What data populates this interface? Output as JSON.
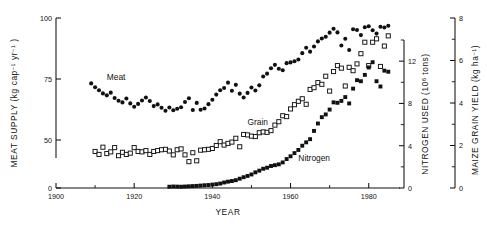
{
  "chart_data": {
    "type": "scatter",
    "title": "",
    "xlabel": "YEAR",
    "xlim": [
      1900,
      1988
    ],
    "x_major_ticks": [
      1900,
      1920,
      1940,
      1960,
      1980
    ],
    "x_minor_ticks": [
      1910,
      1930,
      1950,
      1970
    ],
    "grid": false,
    "legend": "inline-labels",
    "axes": [
      {
        "id": "meat",
        "label": "MEAT SUPPLY",
        "units": "(kg cap−1 yr−1)",
        "unit_parts": [
          "(kg cap",
          "−1",
          " yr",
          "−1",
          ")"
        ],
        "side": "left",
        "ticks": [
          0,
          50,
          75,
          100
        ],
        "broken": true,
        "range": [
          45,
          102
        ]
      },
      {
        "id": "nitrogen",
        "label": "NITROGEN USED",
        "units": "(10⁶ tons)",
        "unit_parts": [
          "(10",
          "6",
          " tons)"
        ],
        "side": "right-inner",
        "ticks": [
          0,
          4,
          8,
          12
        ],
        "minor_ticks": [
          2,
          6,
          10,
          14
        ],
        "range": [
          0,
          14
        ]
      },
      {
        "id": "maize",
        "label": "MAIZE GRAIN YIELD",
        "units": "(kg ha−1)",
        "unit_parts": [
          "(kg ha",
          "−1",
          ")"
        ],
        "side": "right-outer",
        "ticks": [
          0,
          2,
          4,
          6,
          8
        ],
        "minor_ticks": [
          1,
          3,
          5,
          7
        ],
        "range": [
          0,
          8
        ]
      }
    ],
    "series": [
      {
        "name": "Meat",
        "marker": "filled-circle",
        "axis": "meat",
        "label_position": {
          "year": 1913,
          "value": 74.5
        },
        "points": [
          [
            1909,
            73.2
          ],
          [
            1910,
            71.6
          ],
          [
            1911,
            70.4
          ],
          [
            1912,
            69.1
          ],
          [
            1913,
            68.3
          ],
          [
            1914,
            69.4
          ],
          [
            1915,
            67.2
          ],
          [
            1916,
            66.1
          ],
          [
            1917,
            65.4
          ],
          [
            1918,
            67.0
          ],
          [
            1919,
            65.0
          ],
          [
            1920,
            63.6
          ],
          [
            1921,
            64.8
          ],
          [
            1922,
            66.2
          ],
          [
            1923,
            67.4
          ],
          [
            1924,
            66.0
          ],
          [
            1925,
            63.9
          ],
          [
            1926,
            64.6
          ],
          [
            1927,
            63.2
          ],
          [
            1928,
            62.0
          ],
          [
            1929,
            63.3
          ],
          [
            1930,
            62.2
          ],
          [
            1931,
            62.8
          ],
          [
            1932,
            63.4
          ],
          [
            1933,
            65.6
          ],
          [
            1934,
            67.1
          ],
          [
            1935,
            62.3
          ],
          [
            1936,
            65.2
          ],
          [
            1937,
            62.4
          ],
          [
            1938,
            62.9
          ],
          [
            1939,
            64.7
          ],
          [
            1940,
            66.5
          ],
          [
            1941,
            68.6
          ],
          [
            1942,
            70.4
          ],
          [
            1943,
            71.3
          ],
          [
            1944,
            73.5
          ],
          [
            1945,
            70.2
          ],
          [
            1946,
            72.6
          ],
          [
            1947,
            69.0
          ],
          [
            1948,
            67.4
          ],
          [
            1949,
            69.3
          ],
          [
            1950,
            71.5
          ],
          [
            1951,
            70.3
          ],
          [
            1952,
            72.4
          ],
          [
            1953,
            76.0
          ],
          [
            1954,
            77.2
          ],
          [
            1955,
            79.4
          ],
          [
            1956,
            80.8
          ],
          [
            1957,
            79.2
          ],
          [
            1958,
            78.6
          ],
          [
            1959,
            81.5
          ],
          [
            1960,
            81.8
          ],
          [
            1961,
            82.3
          ],
          [
            1962,
            83.0
          ],
          [
            1963,
            85.6
          ],
          [
            1964,
            87.8
          ],
          [
            1965,
            86.2
          ],
          [
            1966,
            88.3
          ],
          [
            1967,
            90.4
          ],
          [
            1968,
            91.6
          ],
          [
            1969,
            92.3
          ],
          [
            1970,
            94.0
          ],
          [
            1971,
            95.6
          ],
          [
            1972,
            94.1
          ],
          [
            1973,
            88.7
          ],
          [
            1974,
            91.5
          ],
          [
            1975,
            86.9
          ],
          [
            1976,
            95.4
          ],
          [
            1977,
            95.1
          ],
          [
            1978,
            93.0
          ],
          [
            1979,
            96.2
          ],
          [
            1980,
            96.6
          ],
          [
            1981,
            95.0
          ],
          [
            1982,
            93.6
          ],
          [
            1983,
            96.4
          ],
          [
            1984,
            96.1
          ],
          [
            1985,
            96.8
          ]
        ]
      },
      {
        "name": "Grain",
        "marker": "open-square",
        "axis": "maize",
        "label_position": {
          "year": 1949,
          "value": 2.95
        },
        "points": [
          [
            1910,
            1.72
          ],
          [
            1911,
            1.58
          ],
          [
            1912,
            1.92
          ],
          [
            1913,
            1.62
          ],
          [
            1914,
            1.7
          ],
          [
            1915,
            1.9
          ],
          [
            1916,
            1.52
          ],
          [
            1917,
            1.68
          ],
          [
            1918,
            1.58
          ],
          [
            1919,
            1.64
          ],
          [
            1920,
            1.9
          ],
          [
            1921,
            1.72
          ],
          [
            1922,
            1.7
          ],
          [
            1923,
            1.76
          ],
          [
            1924,
            1.58
          ],
          [
            1925,
            1.72
          ],
          [
            1926,
            1.76
          ],
          [
            1927,
            1.8
          ],
          [
            1928,
            1.82
          ],
          [
            1929,
            1.74
          ],
          [
            1930,
            1.56
          ],
          [
            1931,
            1.8
          ],
          [
            1932,
            1.84
          ],
          [
            1933,
            1.56
          ],
          [
            1934,
            1.24
          ],
          [
            1935,
            1.66
          ],
          [
            1936,
            1.28
          ],
          [
            1937,
            1.78
          ],
          [
            1938,
            1.8
          ],
          [
            1939,
            1.82
          ],
          [
            1940,
            1.86
          ],
          [
            1941,
            2.0
          ],
          [
            1942,
            2.18
          ],
          [
            1943,
            2.02
          ],
          [
            1944,
            2.1
          ],
          [
            1945,
            2.16
          ],
          [
            1946,
            2.34
          ],
          [
            1947,
            1.94
          ],
          [
            1948,
            2.52
          ],
          [
            1949,
            2.5
          ],
          [
            1950,
            2.44
          ],
          [
            1951,
            2.42
          ],
          [
            1952,
            2.6
          ],
          [
            1953,
            2.64
          ],
          [
            1954,
            2.62
          ],
          [
            1955,
            2.7
          ],
          [
            1956,
            2.96
          ],
          [
            1957,
            3.12
          ],
          [
            1958,
            3.4
          ],
          [
            1959,
            3.36
          ],
          [
            1960,
            3.72
          ],
          [
            1961,
            3.92
          ],
          [
            1962,
            4.08
          ],
          [
            1963,
            4.2
          ],
          [
            1964,
            3.94
          ],
          [
            1965,
            4.64
          ],
          [
            1966,
            4.72
          ],
          [
            1967,
            4.96
          ],
          [
            1968,
            4.88
          ],
          [
            1969,
            5.26
          ],
          [
            1970,
            4.56
          ],
          [
            1971,
            5.48
          ],
          [
            1972,
            5.76
          ],
          [
            1973,
            5.64
          ],
          [
            1974,
            4.8
          ],
          [
            1975,
            5.68
          ],
          [
            1976,
            5.52
          ],
          [
            1977,
            5.84
          ],
          [
            1978,
            6.32
          ],
          [
            1979,
            6.86
          ],
          [
            1980,
            5.76
          ],
          [
            1981,
            6.86
          ],
          [
            1982,
            7.02
          ],
          [
            1983,
            5.72
          ],
          [
            1984,
            6.68
          ],
          [
            1985,
            7.16
          ]
        ]
      },
      {
        "name": "Nitrogen",
        "marker": "filled-square",
        "axis": "nitrogen",
        "label_position": {
          "year": 1962,
          "value": 2.6
        },
        "points": [
          [
            1929,
            0.12
          ],
          [
            1930,
            0.14
          ],
          [
            1931,
            0.13
          ],
          [
            1932,
            0.12
          ],
          [
            1933,
            0.14
          ],
          [
            1934,
            0.16
          ],
          [
            1935,
            0.18
          ],
          [
            1936,
            0.2
          ],
          [
            1937,
            0.23
          ],
          [
            1938,
            0.26
          ],
          [
            1939,
            0.28
          ],
          [
            1940,
            0.32
          ],
          [
            1941,
            0.36
          ],
          [
            1942,
            0.42
          ],
          [
            1943,
            0.52
          ],
          [
            1944,
            0.6
          ],
          [
            1945,
            0.66
          ],
          [
            1946,
            0.74
          ],
          [
            1947,
            0.88
          ],
          [
            1948,
            1.02
          ],
          [
            1949,
            1.14
          ],
          [
            1950,
            1.28
          ],
          [
            1951,
            1.48
          ],
          [
            1952,
            1.64
          ],
          [
            1953,
            1.82
          ],
          [
            1954,
            1.92
          ],
          [
            1955,
            2.08
          ],
          [
            1956,
            2.16
          ],
          [
            1957,
            2.24
          ],
          [
            1958,
            2.42
          ],
          [
            1959,
            2.74
          ],
          [
            1960,
            3.0
          ],
          [
            1961,
            3.3
          ],
          [
            1962,
            3.6
          ],
          [
            1963,
            4.0
          ],
          [
            1964,
            4.32
          ],
          [
            1965,
            4.62
          ],
          [
            1966,
            5.4
          ],
          [
            1967,
            6.1
          ],
          [
            1968,
            6.7
          ],
          [
            1969,
            6.96
          ],
          [
            1970,
            7.42
          ],
          [
            1971,
            8.1
          ],
          [
            1972,
            8.06
          ],
          [
            1973,
            8.24
          ],
          [
            1974,
            8.6
          ],
          [
            1975,
            8.0
          ],
          [
            1976,
            9.4
          ],
          [
            1977,
            10.2
          ],
          [
            1978,
            10.1
          ],
          [
            1979,
            10.7
          ],
          [
            1980,
            11.4
          ],
          [
            1981,
            11.9
          ],
          [
            1982,
            10.1
          ],
          [
            1983,
            9.6
          ],
          [
            1984,
            11.1
          ],
          [
            1985,
            11.0
          ]
        ]
      }
    ]
  }
}
